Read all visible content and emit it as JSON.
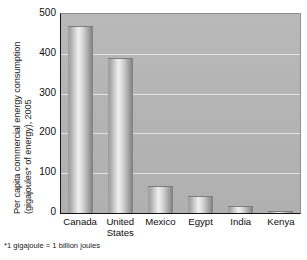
{
  "chart_data": {
    "type": "bar",
    "title": "",
    "subtitle": "",
    "xlabel": "",
    "ylabel": "Per capita commercial energy consumption (gigajoules* of energy), 2005",
    "ylabel_lines": [
      "Per capita commercial energy consumption",
      "(gigajoules* of energy), 2005"
    ],
    "categories": [
      "Canada",
      "United States",
      "Mexico",
      "Egypt",
      "India",
      "Kenya"
    ],
    "values": [
      470,
      390,
      68,
      43,
      18,
      5
    ],
    "ylim": [
      0,
      500
    ],
    "yticks": [
      500,
      400,
      300,
      200,
      100,
      0
    ],
    "ytick_labels": [
      "500",
      "400",
      "300",
      "200",
      "100",
      "0"
    ],
    "grid": true,
    "grid_axis": "y",
    "legend": false,
    "legend_position": "none",
    "footnote": "*1 gigajoule = 1 billion joules",
    "bar_color": "#c8c8c8",
    "plot_background": "#b4b4b4",
    "gridline_color": "#e2e2e2",
    "axis_color": "#141414"
  }
}
